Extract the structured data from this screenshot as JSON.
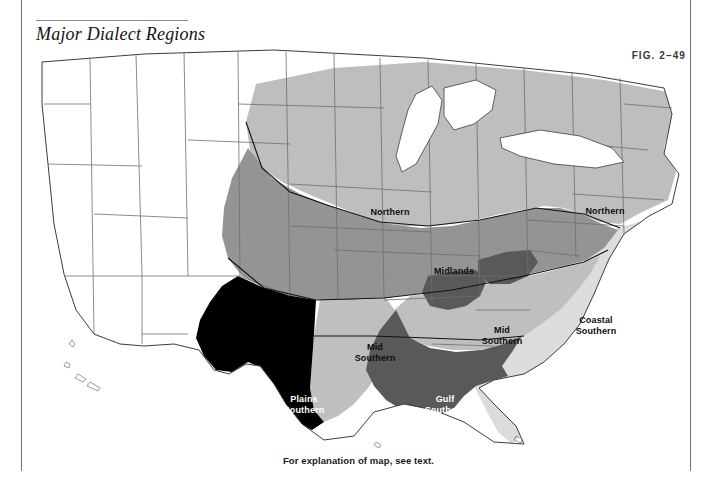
{
  "figure": {
    "title": "Major Dialect Regions",
    "fig_number": "Fig. 2–49",
    "caption": "For explanation of map, see text."
  },
  "palette": {
    "unshaded": "#ffffff",
    "coastal_southern": "#dcdcdc",
    "northern": "#bebebe",
    "mid_southern": "#bfbfbf",
    "midlands": "#949494",
    "gulf_southern": "#595959",
    "plains_southern": "#000000",
    "outline": "#6e6e6e",
    "region_outline": "#121212",
    "rule": "#6f6f6f"
  },
  "map": {
    "name": "united-states-dialect-regions",
    "projection_note": "contiguous United States, state outlines",
    "labels": [
      {
        "id": "northern-midwest",
        "text": "Northern",
        "x": 366,
        "y": 168,
        "tone": "dark"
      },
      {
        "id": "northern-northeast",
        "text": "Northern",
        "x": 581,
        "y": 167,
        "tone": "dark"
      },
      {
        "id": "midlands",
        "text": "Midlands",
        "x": 430,
        "y": 227,
        "tone": "dark"
      },
      {
        "id": "mid-southern-west",
        "text": "Mid\nSouthern",
        "x": 351,
        "y": 308,
        "tone": "dark"
      },
      {
        "id": "mid-southern-east",
        "text": "Mid\nSouthern",
        "x": 478,
        "y": 291,
        "tone": "dark"
      },
      {
        "id": "coastal-southern",
        "text": "Coastal\nSouthern",
        "x": 572,
        "y": 281,
        "tone": "dark"
      },
      {
        "id": "gulf-southern",
        "text": "Gulf\nSouthern",
        "x": 421,
        "y": 360,
        "tone": "light"
      },
      {
        "id": "plains-southern",
        "text": "Plains\nSouthern",
        "x": 280,
        "y": 360,
        "tone": "light"
      }
    ],
    "legend_regions": [
      {
        "name": "Northern",
        "shade": "#bebebe"
      },
      {
        "name": "Midlands",
        "shade": "#949494"
      },
      {
        "name": "Mid Southern",
        "shade": "#bfbfbf"
      },
      {
        "name": "Coastal Southern",
        "shade": "#dcdcdc"
      },
      {
        "name": "Gulf Southern",
        "shade": "#595959"
      },
      {
        "name": "Plains Southern",
        "shade": "#000000"
      }
    ]
  }
}
